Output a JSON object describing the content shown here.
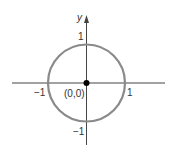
{
  "diagram": {
    "axes": {
      "x_label": "",
      "y_label": "y",
      "x_ticks": [
        {
          "value": -1,
          "label": "−1"
        },
        {
          "value": 1,
          "label": "1"
        }
      ],
      "y_ticks": [
        {
          "value": 1,
          "label": "1"
        },
        {
          "value": -1,
          "label": "−1"
        }
      ]
    },
    "circle": {
      "center": [
        0,
        0
      ],
      "radius": 1,
      "color": "#8a8a8a"
    },
    "center_point": {
      "label": "(0,0)",
      "color": "#000000"
    }
  },
  "labels": {
    "y_axis": "y",
    "x_neg1": "−1",
    "x_pos1": "1",
    "y_pos1": "1",
    "y_neg1": "−1",
    "origin": "(0,0)"
  }
}
